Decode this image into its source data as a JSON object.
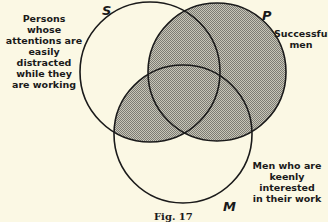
{
  "diagram": {
    "type": "venn",
    "circles": [
      {
        "id": "S",
        "letter": "S",
        "label": "Persons whose attentions are easily distracted while they are working",
        "cx": 150,
        "cy": 72,
        "r": 70
      },
      {
        "id": "P",
        "letter": "P",
        "label": "Successful men",
        "cx": 217,
        "cy": 72,
        "r": 69
      },
      {
        "id": "M",
        "letter": "M",
        "label": "Men who are keenly interested in their work",
        "cx": 183,
        "cy": 134,
        "r": 69
      }
    ],
    "shaded_regions": [
      "P (entire)",
      "S∩M outside P"
    ],
    "shade_color": "#a9a9a2",
    "caption": "Fig. 17"
  },
  "labels": {
    "s_lines": [
      "Persons whose",
      "attentions are",
      "easily distracted",
      "while they",
      "are working"
    ],
    "p_lines": [
      "Successful",
      "men"
    ],
    "m_lines": [
      "Men who are",
      "keenly interested",
      "in their work"
    ],
    "s_letter": "S",
    "p_letter": "P",
    "m_letter": "M",
    "caption": "Fig. 17"
  }
}
